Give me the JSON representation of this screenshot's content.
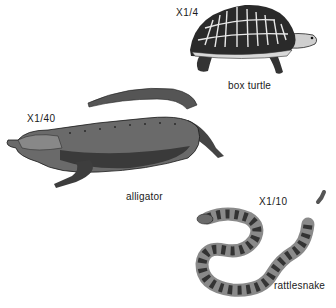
{
  "figure": {
    "animals": [
      {
        "id": "box-turtle",
        "name": "box turtle",
        "scale": "X1/4"
      },
      {
        "id": "alligator",
        "name": "alligator",
        "scale": "X1/40"
      },
      {
        "id": "rattlesnake",
        "name": "rattlesnake",
        "scale": "X1/10"
      }
    ]
  },
  "colors": {
    "ink": "#1a1a1a",
    "shade": "#555555",
    "light": "#bdbdbd",
    "paper": "#ffffff"
  }
}
